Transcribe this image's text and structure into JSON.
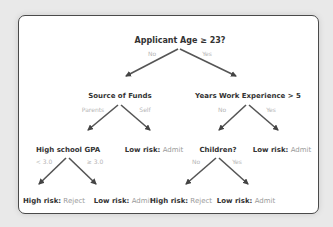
{
  "root": {
    "label": "Applicant Age ≥ 23?",
    "no": "No",
    "yes": "Yes"
  },
  "source_of_funds": {
    "label": "Source of Funds",
    "left": "Parents",
    "right": "Self"
  },
  "work_experience": {
    "label": "Years Work Experience > 5",
    "left": "No",
    "right": "Yes"
  },
  "gpa": {
    "label": "High school GPA",
    "left": "< 3.0",
    "right": "≥ 3.0"
  },
  "children": {
    "label": "Children?",
    "left": "No",
    "right": "Yes"
  },
  "leaves": {
    "self": {
      "risk": "Low risk:",
      "decision": "Admit"
    },
    "work_yes": {
      "risk": "Low risk:",
      "decision": "Admit"
    },
    "gpa_low": {
      "risk": "High risk:",
      "decision": "Reject"
    },
    "gpa_high": {
      "risk": "Low risk:",
      "decision": "Admit"
    },
    "children_no": {
      "risk": "High risk:",
      "decision": "Reject"
    },
    "children_yes": {
      "risk": "Low risk:",
      "decision": "Admit"
    }
  },
  "colors": {
    "arrow": "#555555",
    "decision_text": "#9a9a9a",
    "edge_label": "#b5b5b5",
    "node_text": "#333333"
  }
}
